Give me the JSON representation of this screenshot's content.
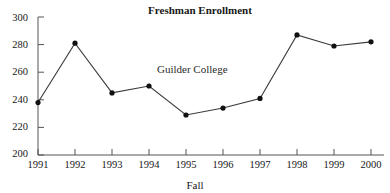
{
  "chart_data": {
    "type": "line",
    "title": "Freshman Enrollment",
    "xlabel": "Fall",
    "ylabel": "",
    "categories": [
      "1991",
      "1992",
      "1993",
      "1994",
      "1995",
      "1996",
      "1997",
      "1998",
      "1999",
      "2000"
    ],
    "x": [
      1991,
      1992,
      1993,
      1994,
      1995,
      1996,
      1997,
      1998,
      1999,
      2000
    ],
    "values": [
      238,
      281,
      245,
      250,
      229,
      234,
      241,
      287,
      279,
      282
    ],
    "series": [
      {
        "name": "Guilder College",
        "values": [
          238,
          281,
          245,
          250,
          229,
          234,
          241,
          287,
          279,
          282
        ]
      }
    ],
    "annotations": [
      {
        "text": "Guilder College",
        "x": 1994.4,
        "y": 259
      }
    ],
    "ylim": [
      200,
      300
    ],
    "yticks": [
      200,
      220,
      240,
      260,
      280,
      300
    ],
    "ytick_labels": [
      "200",
      "220",
      "240",
      "260",
      "280",
      "300"
    ],
    "xtick_labels": [
      "1991",
      "1992",
      "1993",
      "1994",
      "1995",
      "1996",
      "1997",
      "1998",
      "1999",
      "2000"
    ],
    "grid": false,
    "legend": "none",
    "marker": "circle",
    "line_color": "#3a3a3a",
    "marker_color": "#111111",
    "background": "#ffffff"
  },
  "labels": {
    "title": "Freshman Enrollment",
    "annotation_series": "Guilder College",
    "xaxis_title": "Fall",
    "y": {
      "t300": "300",
      "t280": "280",
      "t260": "260",
      "t240": "240",
      "t220": "220",
      "t200": "200"
    },
    "x": {
      "y1991": "1991",
      "y1992": "1992",
      "y1993": "1993",
      "y1994": "1994",
      "y1995": "1995",
      "y1996": "1996",
      "y1997": "1997",
      "y1998": "1998",
      "y1999": "1999",
      "y2000": "2000"
    }
  }
}
